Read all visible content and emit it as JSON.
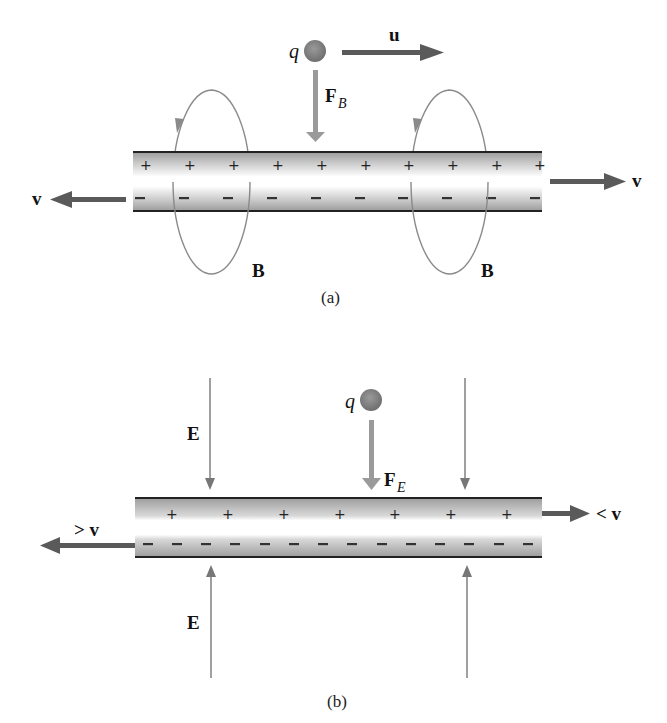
{
  "panel_a": {
    "caption": "(a)",
    "charge_label": "q",
    "velocity_u_label": "u",
    "force_label_main": "F",
    "force_label_sub": "B",
    "wire_left_velocity_label": "v",
    "wire_right_velocity_label": "v",
    "field_label_left": "B",
    "field_label_right": "B",
    "plus_sign": "+",
    "minus_sign": "−",
    "plus_count": 10,
    "minus_count": 10
  },
  "panel_b": {
    "caption": "(b)",
    "charge_label": "q",
    "force_label_main": "F",
    "force_label_sub": "E",
    "field_label_top": "E",
    "field_label_bottom": "E",
    "left_velocity_label": "> v",
    "right_velocity_label": "< v",
    "plus_sign": "+",
    "minus_sign": "−",
    "plus_count": 7,
    "minus_count": 14
  },
  "colors": {
    "arrow_dark": "#5a5a5a",
    "arrow_light": "#9a9a9a",
    "field_line": "#777777",
    "wire_edge": "#222222",
    "wire_shade": "#b8b8b8",
    "charge_fill": "#7a7a7a"
  }
}
